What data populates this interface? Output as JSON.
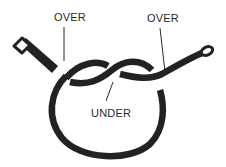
{
  "diagram": {
    "type": "knot-illustration",
    "colors": {
      "rope": "#222222",
      "background": "#ffffff",
      "label_text": "#2a2a2a",
      "leader_line": "#2a2a2a"
    },
    "labels": [
      {
        "id": "over-left",
        "text": "OVER"
      },
      {
        "id": "over-right",
        "text": "OVER"
      },
      {
        "id": "under",
        "text": "UNDER"
      }
    ],
    "rope_parts": [
      {
        "id": "left-end",
        "description": "rope end (whipped tip) upper left"
      },
      {
        "id": "loop",
        "description": "large round loop"
      },
      {
        "id": "crossing",
        "description": "central over/under crossing"
      },
      {
        "id": "right-end",
        "description": "rope end (whipped tip) upper right"
      }
    ]
  }
}
